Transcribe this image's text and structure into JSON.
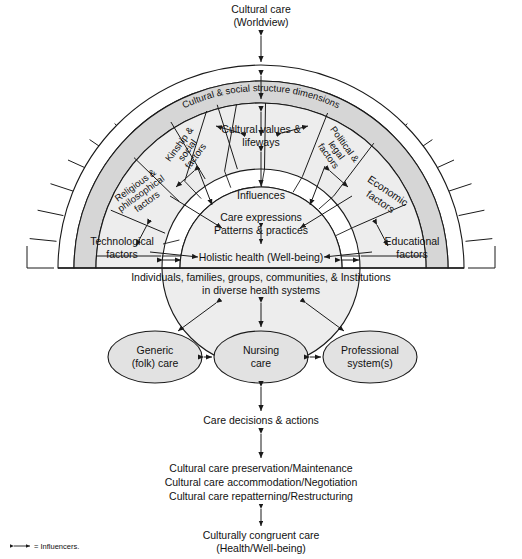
{
  "diagram": {
    "title_top": {
      "line1": "Cultural care",
      "line2": "(Worldview)"
    },
    "outer_band_label": "Cultural & social structure dimensions",
    "center": {
      "influences": "Influences",
      "care_expressions_line1": "Care expressions",
      "care_expressions_line2": "Patterns & practices",
      "holistic": "Holistic health (Well-being)"
    },
    "sectors": [
      {
        "id": "technological",
        "line1": "Technological",
        "line2": "factors"
      },
      {
        "id": "religious-philosophical",
        "line1": "Religious &",
        "line2": "philosophical",
        "line3": "factors"
      },
      {
        "id": "kinship-social",
        "line1": "Kinship &",
        "line2": "social",
        "line3": "factors"
      },
      {
        "id": "cultural-values-lifeways",
        "line1": "Cultural values &",
        "line2": "lifeways"
      },
      {
        "id": "political-legal",
        "line1": "Political &",
        "line2": "legal",
        "line3": "factors"
      },
      {
        "id": "economic",
        "line1": "Economic",
        "line2": "factors"
      },
      {
        "id": "educational",
        "line1": "Educational",
        "line2": "factors"
      }
    ],
    "baseline_caption": {
      "line1": "Individuals, families, groups, communities, & Institutions",
      "line2": "in diverse health systems"
    },
    "nodes": [
      {
        "id": "generic-folk-care",
        "line1": "Generic",
        "line2": "(folk) care"
      },
      {
        "id": "nursing-care",
        "line1": "Nursing",
        "line2": "care"
      },
      {
        "id": "professional-systems",
        "line1": "Professional",
        "line2": "system(s)"
      }
    ],
    "care_decisions": "Care decisions & actions",
    "modes": [
      "Cultural care preservation/Maintenance",
      "Cultural care accommodation/Negotiation",
      "Cultural care repatterning/Restructuring"
    ],
    "outcome": {
      "line1": "Culturally congruent care",
      "line2": "(Health/Well-being)"
    },
    "legend": {
      "text": "= Influencers."
    },
    "colors": {
      "stroke": "#1a1a1a",
      "band_shade": "#d6d6d6",
      "sector_fill": "#ededed",
      "core_fill": "#efefef",
      "node_fill": "#e2e2e2",
      "page_bg": "#ffffff"
    }
  }
}
